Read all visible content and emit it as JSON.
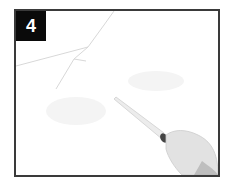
{
  "figure": {
    "step_number": "4",
    "colors": {
      "badge_bg": "#0a0a0a",
      "badge_text": "#ffffff",
      "frame_border": "#3a3a3a",
      "background": "#ffffff"
    }
  }
}
